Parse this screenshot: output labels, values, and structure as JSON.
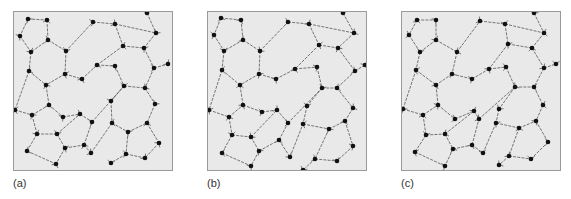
{
  "figure": {
    "colors": {
      "panel_bg": "#e9e9e9",
      "panel_border": "#9a9a9a",
      "node": "#111111",
      "bond": "#555555",
      "hydrogen": "#777777"
    },
    "panels": [
      {
        "label": "(a)",
        "nodes": [
          [
            15,
            8
          ],
          [
            34,
            9
          ],
          [
            7,
            25
          ],
          [
            35,
            29
          ],
          [
            18,
            41
          ],
          [
            53,
            40
          ],
          [
            16,
            60
          ],
          [
            52,
            63
          ],
          [
            33,
            74
          ],
          [
            69,
            68
          ],
          [
            80,
            11
          ],
          [
            102,
            13
          ],
          [
            134,
            2
          ],
          [
            143,
            22
          ],
          [
            110,
            35
          ],
          [
            131,
            37
          ],
          [
            84,
            54
          ],
          [
            102,
            55
          ],
          [
            141,
            57
          ],
          [
            155,
            53
          ],
          [
            111,
            75
          ],
          [
            132,
            77
          ],
          [
            2,
            99
          ],
          [
            19,
            104
          ],
          [
            36,
            94
          ],
          [
            50,
            106
          ],
          [
            67,
            103
          ],
          [
            24,
            123
          ],
          [
            44,
            123
          ],
          [
            14,
            140
          ],
          [
            52,
            137
          ],
          [
            71,
            134
          ],
          [
            43,
            153
          ],
          [
            79,
            111
          ],
          [
            78,
            142
          ],
          [
            98,
            90
          ],
          [
            142,
            93
          ],
          [
            99,
            112
          ],
          [
            115,
            121
          ],
          [
            134,
            112
          ],
          [
            146,
            132
          ],
          [
            113,
            143
          ],
          [
            132,
            147
          ],
          [
            98,
            152
          ]
        ],
        "edges": [
          [
            0,
            1
          ],
          [
            0,
            2
          ],
          [
            1,
            3
          ],
          [
            2,
            4
          ],
          [
            3,
            4
          ],
          [
            3,
            5
          ],
          [
            4,
            6
          ],
          [
            5,
            7
          ],
          [
            6,
            8
          ],
          [
            7,
            8
          ],
          [
            7,
            9
          ],
          [
            5,
            10
          ],
          [
            10,
            11
          ],
          [
            11,
            13
          ],
          [
            12,
            13
          ],
          [
            13,
            15
          ],
          [
            14,
            15
          ],
          [
            11,
            14
          ],
          [
            14,
            16
          ],
          [
            15,
            18
          ],
          [
            16,
            17
          ],
          [
            17,
            20
          ],
          [
            18,
            19
          ],
          [
            18,
            21
          ],
          [
            20,
            21
          ],
          [
            9,
            16
          ],
          [
            6,
            22
          ],
          [
            22,
            23
          ],
          [
            23,
            24
          ],
          [
            24,
            25
          ],
          [
            25,
            26
          ],
          [
            24,
            8
          ],
          [
            23,
            27
          ],
          [
            27,
            28
          ],
          [
            28,
            26
          ],
          [
            27,
            29
          ],
          [
            29,
            32
          ],
          [
            28,
            30
          ],
          [
            30,
            31
          ],
          [
            31,
            33
          ],
          [
            26,
            33
          ],
          [
            33,
            20
          ],
          [
            31,
            34
          ],
          [
            34,
            37
          ],
          [
            20,
            35
          ],
          [
            35,
            37
          ],
          [
            21,
            36
          ],
          [
            36,
            39
          ],
          [
            37,
            38
          ],
          [
            38,
            39
          ],
          [
            39,
            40
          ],
          [
            38,
            41
          ],
          [
            41,
            42
          ],
          [
            40,
            42
          ],
          [
            41,
            43
          ],
          [
            30,
            32
          ]
        ]
      },
      {
        "label": "(b)",
        "nodes": [
          [
            14,
            7
          ],
          [
            34,
            9
          ],
          [
            7,
            24
          ],
          [
            36,
            29
          ],
          [
            17,
            40
          ],
          [
            53,
            40
          ],
          [
            15,
            59
          ],
          [
            52,
            63
          ],
          [
            33,
            74
          ],
          [
            69,
            68
          ],
          [
            81,
            11
          ],
          [
            102,
            13
          ],
          [
            136,
            2
          ],
          [
            147,
            22
          ],
          [
            112,
            34
          ],
          [
            131,
            37
          ],
          [
            88,
            58
          ],
          [
            110,
            56
          ],
          [
            148,
            60
          ],
          [
            158,
            54
          ],
          [
            115,
            77
          ],
          [
            130,
            77
          ],
          [
            2,
            99
          ],
          [
            22,
            106
          ],
          [
            36,
            94
          ],
          [
            55,
            101
          ],
          [
            70,
            99
          ],
          [
            25,
            124
          ],
          [
            44,
            126
          ],
          [
            15,
            142
          ],
          [
            52,
            140
          ],
          [
            72,
            129
          ],
          [
            44,
            155
          ],
          [
            81,
            112
          ],
          [
            83,
            146
          ],
          [
            100,
            95
          ],
          [
            146,
            97
          ],
          [
            96,
            113
          ],
          [
            122,
            118
          ],
          [
            138,
            110
          ],
          [
            146,
            135
          ],
          [
            108,
            148
          ],
          [
            130,
            150
          ],
          [
            96,
            159
          ]
        ],
        "edges": [
          [
            0,
            1
          ],
          [
            0,
            2
          ],
          [
            1,
            3
          ],
          [
            2,
            4
          ],
          [
            3,
            4
          ],
          [
            3,
            5
          ],
          [
            4,
            6
          ],
          [
            5,
            7
          ],
          [
            6,
            8
          ],
          [
            7,
            8
          ],
          [
            7,
            9
          ],
          [
            5,
            10
          ],
          [
            10,
            11
          ],
          [
            11,
            13
          ],
          [
            12,
            13
          ],
          [
            13,
            15
          ],
          [
            14,
            15
          ],
          [
            11,
            14
          ],
          [
            14,
            16
          ],
          [
            15,
            18
          ],
          [
            16,
            17
          ],
          [
            17,
            20
          ],
          [
            18,
            19
          ],
          [
            18,
            21
          ],
          [
            20,
            21
          ],
          [
            9,
            16
          ],
          [
            6,
            22
          ],
          [
            22,
            23
          ],
          [
            23,
            24
          ],
          [
            24,
            25
          ],
          [
            25,
            26
          ],
          [
            24,
            8
          ],
          [
            23,
            27
          ],
          [
            27,
            28
          ],
          [
            28,
            26
          ],
          [
            27,
            29
          ],
          [
            29,
            32
          ],
          [
            28,
            30
          ],
          [
            30,
            31
          ],
          [
            31,
            33
          ],
          [
            26,
            33
          ],
          [
            33,
            20
          ],
          [
            31,
            34
          ],
          [
            34,
            37
          ],
          [
            20,
            35
          ],
          [
            35,
            37
          ],
          [
            21,
            36
          ],
          [
            36,
            39
          ],
          [
            37,
            38
          ],
          [
            38,
            39
          ],
          [
            39,
            40
          ],
          [
            38,
            41
          ],
          [
            41,
            42
          ],
          [
            40,
            42
          ],
          [
            41,
            43
          ],
          [
            30,
            32
          ]
        ]
      },
      {
        "label": "(c)",
        "nodes": [
          [
            16,
            9
          ],
          [
            35,
            9
          ],
          [
            8,
            24
          ],
          [
            35,
            29
          ],
          [
            19,
            41
          ],
          [
            56,
            41
          ],
          [
            15,
            59
          ],
          [
            51,
            63
          ],
          [
            35,
            74
          ],
          [
            71,
            68
          ],
          [
            79,
            10
          ],
          [
            104,
            13
          ],
          [
            133,
            2
          ],
          [
            143,
            22
          ],
          [
            107,
            33
          ],
          [
            131,
            37
          ],
          [
            88,
            58
          ],
          [
            105,
            56
          ],
          [
            143,
            57
          ],
          [
            155,
            53
          ],
          [
            114,
            76
          ],
          [
            133,
            76
          ],
          [
            2,
            98
          ],
          [
            22,
            104
          ],
          [
            37,
            94
          ],
          [
            54,
            108
          ],
          [
            73,
            100
          ],
          [
            25,
            124
          ],
          [
            44,
            123
          ],
          [
            14,
            141
          ],
          [
            52,
            138
          ],
          [
            71,
            134
          ],
          [
            44,
            155
          ],
          [
            78,
            108
          ],
          [
            82,
            142
          ],
          [
            98,
            98
          ],
          [
            142,
            94
          ],
          [
            95,
            112
          ],
          [
            118,
            117
          ],
          [
            135,
            110
          ],
          [
            147,
            131
          ],
          [
            108,
            145
          ],
          [
            130,
            148
          ],
          [
            98,
            154
          ]
        ],
        "edges": [
          [
            0,
            1
          ],
          [
            0,
            2
          ],
          [
            1,
            3
          ],
          [
            2,
            4
          ],
          [
            3,
            4
          ],
          [
            3,
            5
          ],
          [
            4,
            6
          ],
          [
            5,
            7
          ],
          [
            6,
            8
          ],
          [
            7,
            8
          ],
          [
            7,
            9
          ],
          [
            5,
            10
          ],
          [
            10,
            11
          ],
          [
            11,
            13
          ],
          [
            12,
            13
          ],
          [
            13,
            15
          ],
          [
            14,
            15
          ],
          [
            11,
            14
          ],
          [
            14,
            16
          ],
          [
            15,
            18
          ],
          [
            16,
            17
          ],
          [
            17,
            20
          ],
          [
            18,
            19
          ],
          [
            18,
            21
          ],
          [
            20,
            21
          ],
          [
            9,
            16
          ],
          [
            6,
            22
          ],
          [
            22,
            23
          ],
          [
            23,
            24
          ],
          [
            24,
            25
          ],
          [
            25,
            26
          ],
          [
            24,
            8
          ],
          [
            23,
            27
          ],
          [
            27,
            28
          ],
          [
            28,
            26
          ],
          [
            27,
            29
          ],
          [
            29,
            32
          ],
          [
            28,
            30
          ],
          [
            30,
            31
          ],
          [
            31,
            33
          ],
          [
            26,
            33
          ],
          [
            33,
            20
          ],
          [
            31,
            34
          ],
          [
            34,
            37
          ],
          [
            20,
            35
          ],
          [
            35,
            37
          ],
          [
            21,
            36
          ],
          [
            36,
            39
          ],
          [
            37,
            38
          ],
          [
            38,
            39
          ],
          [
            39,
            40
          ],
          [
            38,
            41
          ],
          [
            41,
            42
          ],
          [
            40,
            42
          ],
          [
            41,
            43
          ],
          [
            30,
            32
          ]
        ]
      }
    ]
  }
}
